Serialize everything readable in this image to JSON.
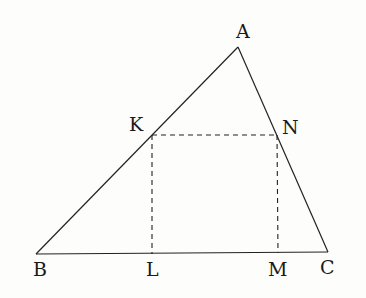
{
  "diagram": {
    "type": "geometry",
    "points": {
      "A": {
        "label": "A",
        "x": 238,
        "y": 47
      },
      "B": {
        "label": "B",
        "x": 36,
        "y": 254
      },
      "C": {
        "label": "C",
        "x": 328,
        "y": 252
      },
      "K": {
        "label": "K",
        "x": 152,
        "y": 135
      },
      "N": {
        "label": "N",
        "x": 277,
        "y": 135
      },
      "L": {
        "label": "L",
        "x": 152,
        "y": 254
      },
      "M": {
        "label": "M",
        "x": 278,
        "y": 253
      }
    },
    "solid_segments": [
      "AB",
      "AC",
      "BC"
    ],
    "dashed_segments": [
      "KN",
      "KL",
      "NM"
    ],
    "labels": {
      "A": "A",
      "B": "B",
      "C": "C",
      "K": "K",
      "L": "L",
      "M": "M",
      "N": "N"
    }
  }
}
